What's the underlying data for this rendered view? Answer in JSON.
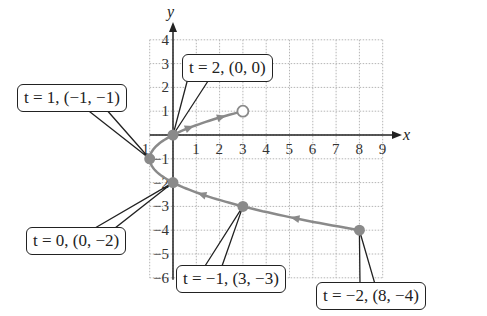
{
  "chart_data": {
    "type": "line",
    "title": "",
    "xlabel": "x",
    "ylabel": "y",
    "xlim": [
      -1,
      9
    ],
    "ylim": [
      -6,
      4
    ],
    "grid": true,
    "x_ticks": [
      "-1",
      "1",
      "2",
      "3",
      "4",
      "5",
      "6",
      "7",
      "8",
      "9"
    ],
    "y_ticks": [
      "4",
      "3",
      "2",
      "1",
      "-1",
      "-2",
      "-3",
      "-4",
      "-5",
      "-6"
    ],
    "series": [
      {
        "name": "parametric curve",
        "points": [
          {
            "t": -2,
            "x": 8,
            "y": -4
          },
          {
            "t": -1,
            "x": 3,
            "y": -3
          },
          {
            "t": 0,
            "x": 0,
            "y": -2
          },
          {
            "t": 1,
            "x": -1,
            "y": -1
          },
          {
            "t": 2,
            "x": 0,
            "y": 0
          },
          {
            "t": 3,
            "x": 3,
            "y": 1,
            "open": true
          }
        ]
      }
    ],
    "annotations": [
      {
        "label": "t = 2, (0, 0)",
        "t": 2,
        "x": 0,
        "y": 0
      },
      {
        "label": "t = 1, (−1, −1)",
        "t": 1,
        "x": -1,
        "y": -1
      },
      {
        "label": "t = 0, (0, −2)",
        "t": 0,
        "x": 0,
        "y": -2
      },
      {
        "label": "t = −1, (3, −3)",
        "t": -1,
        "x": 3,
        "y": -3
      },
      {
        "label": "t = −2, (8, −4)",
        "t": -2,
        "x": 8,
        "y": -4
      }
    ],
    "colors": {
      "curve": "#8a8a8a",
      "axes": "#222222",
      "grid": "#b5b5b5"
    }
  },
  "labels": {
    "x_axis": "x",
    "y_axis": "y",
    "callout_t2": "t = 2, (0, 0)",
    "callout_t1": "t = 1, (−1, −1)",
    "callout_t0": "t = 0, (0, −2)",
    "callout_tm1": "t = −1, (3, −3)",
    "callout_tm2": "t = −2, (8, −4)"
  }
}
